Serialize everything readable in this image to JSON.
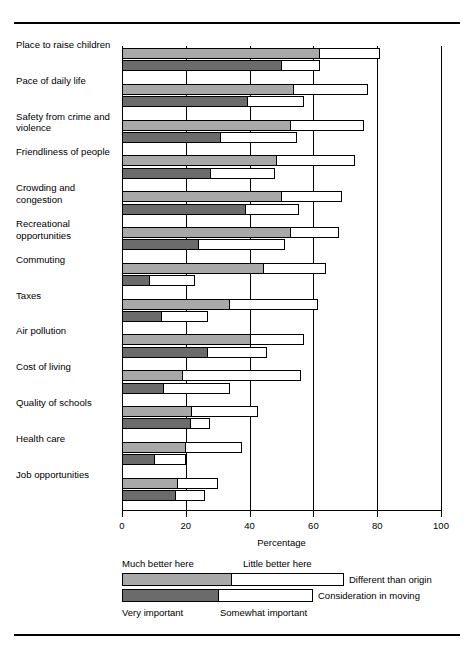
{
  "chart_data": {
    "type": "bar",
    "orientation": "horizontal",
    "title": "",
    "xlabel": "Percentage",
    "ylabel": "",
    "xlim": [
      0,
      100
    ],
    "xticks": [
      0,
      20,
      40,
      60,
      80,
      100
    ],
    "grid": "vertical gridlines at each x tick",
    "legend_position": "below plot",
    "categories": [
      "Place to raise children",
      "Pace of daily life",
      "Safety from crime and violence",
      "Friendliness of people",
      "Crowding and congestion",
      "Recreational opportunities",
      "Commuting",
      "Taxes",
      "Air pollution",
      "Cost of living",
      "Quality of schools",
      "Health care",
      "Job opportunities"
    ],
    "series": [
      {
        "name": "Much better here",
        "bar": "different-than-origin",
        "shade": "light",
        "values": [
          62,
          54,
          53,
          48.5,
          50,
          53,
          44.5,
          34,
          40.5,
          19,
          22,
          20,
          17.5
        ]
      },
      {
        "name": "Little better here",
        "bar": "different-than-origin",
        "shade": "white",
        "values": [
          81,
          77,
          76,
          73,
          69,
          68,
          64,
          61.5,
          57,
          56,
          42.5,
          37.5,
          30
        ]
      },
      {
        "name": "Very important",
        "bar": "consideration-in-moving",
        "shade": "dark",
        "values": [
          50,
          39.5,
          31,
          28,
          39,
          24,
          8.7,
          12.5,
          27,
          13.3,
          21.6,
          10.3,
          17
        ]
      },
      {
        "name": "Somewhat important",
        "bar": "consideration-in-moving",
        "shade": "white",
        "values": [
          62,
          57,
          55,
          48,
          55.5,
          51,
          23,
          27,
          45.5,
          34,
          27.5,
          20,
          26
        ]
      }
    ]
  },
  "legend": {
    "top_left": "Much better here",
    "top_right": "Little better here",
    "bar1_label": "Different than origin",
    "bar2_label": "Consideration in moving",
    "bottom_left": "Very important",
    "bottom_right": "Somewhat important"
  },
  "colors": {
    "light_shade": "#a8a8a8",
    "dark_shade": "#6b6b6b",
    "white_shade": "#ffffff",
    "outline": "#000000"
  }
}
